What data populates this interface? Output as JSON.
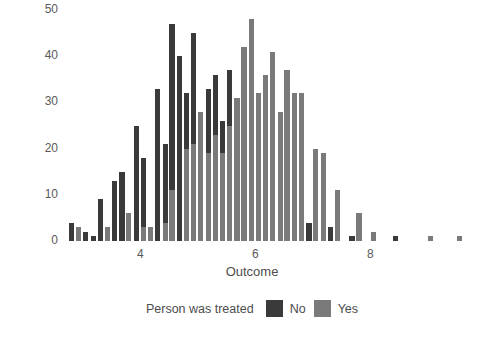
{
  "chart_data": {
    "type": "bar",
    "title": "",
    "xlabel": "Outcome",
    "ylabel": "Number of people",
    "xlim": [
      2.55,
      10.2
    ],
    "ylim": [
      0,
      50
    ],
    "xticks": [
      4,
      6,
      8
    ],
    "yticks": [
      0,
      10,
      20,
      30,
      40,
      50
    ],
    "grid": false,
    "legend_title": "Person was treated",
    "legend_position": "bottom",
    "bin_width": 0.125,
    "series": [
      {
        "name": "No",
        "color": "#3a3a3a",
        "points": [
          {
            "x": 2.8,
            "y": 4
          },
          {
            "x": 3.05,
            "y": 2
          },
          {
            "x": 3.18,
            "y": 1
          },
          {
            "x": 3.3,
            "y": 9
          },
          {
            "x": 3.55,
            "y": 13
          },
          {
            "x": 3.68,
            "y": 15
          },
          {
            "x": 3.93,
            "y": 25
          },
          {
            "x": 4.05,
            "y": 18
          },
          {
            "x": 4.3,
            "y": 33
          },
          {
            "x": 4.43,
            "y": 21
          },
          {
            "x": 4.55,
            "y": 47
          },
          {
            "x": 4.68,
            "y": 40
          },
          {
            "x": 4.8,
            "y": 32
          },
          {
            "x": 4.93,
            "y": 45
          },
          {
            "x": 5.05,
            "y": 19
          },
          {
            "x": 5.18,
            "y": 33
          },
          {
            "x": 5.3,
            "y": 36
          },
          {
            "x": 5.43,
            "y": 26
          },
          {
            "x": 5.55,
            "y": 37
          },
          {
            "x": 5.68,
            "y": 22
          },
          {
            "x": 5.93,
            "y": 17
          },
          {
            "x": 6.05,
            "y": 13
          },
          {
            "x": 6.3,
            "y": 22
          },
          {
            "x": 6.43,
            "y": 15
          },
          {
            "x": 6.55,
            "y": 12
          },
          {
            "x": 6.68,
            "y": 8
          },
          {
            "x": 6.93,
            "y": 4
          },
          {
            "x": 7.05,
            "y": 3
          },
          {
            "x": 7.3,
            "y": 3
          },
          {
            "x": 7.43,
            "y": 2
          },
          {
            "x": 7.68,
            "y": 1
          },
          {
            "x": 8.05,
            "y": 2
          },
          {
            "x": 8.43,
            "y": 1
          }
        ]
      },
      {
        "name": "Yes",
        "color": "#7a7a7a",
        "points": [
          {
            "x": 2.93,
            "y": 3
          },
          {
            "x": 3.43,
            "y": 3
          },
          {
            "x": 3.8,
            "y": 6
          },
          {
            "x": 4.05,
            "y": 3
          },
          {
            "x": 4.18,
            "y": 3
          },
          {
            "x": 4.43,
            "y": 4
          },
          {
            "x": 4.55,
            "y": 11
          },
          {
            "x": 4.8,
            "y": 20
          },
          {
            "x": 4.93,
            "y": 21
          },
          {
            "x": 5.05,
            "y": 28
          },
          {
            "x": 5.18,
            "y": 19
          },
          {
            "x": 5.3,
            "y": 23
          },
          {
            "x": 5.43,
            "y": 19
          },
          {
            "x": 5.55,
            "y": 25
          },
          {
            "x": 5.68,
            "y": 31
          },
          {
            "x": 5.8,
            "y": 42
          },
          {
            "x": 5.93,
            "y": 48
          },
          {
            "x": 6.05,
            "y": 32
          },
          {
            "x": 6.18,
            "y": 36
          },
          {
            "x": 6.3,
            "y": 41
          },
          {
            "x": 6.43,
            "y": 28
          },
          {
            "x": 6.55,
            "y": 37
          },
          {
            "x": 6.68,
            "y": 32
          },
          {
            "x": 6.8,
            "y": 32
          },
          {
            "x": 7.05,
            "y": 20
          },
          {
            "x": 7.18,
            "y": 19
          },
          {
            "x": 7.43,
            "y": 11
          },
          {
            "x": 7.8,
            "y": 6
          },
          {
            "x": 8.05,
            "y": 2
          },
          {
            "x": 9.05,
            "y": 1
          },
          {
            "x": 9.55,
            "y": 1
          }
        ]
      }
    ]
  }
}
